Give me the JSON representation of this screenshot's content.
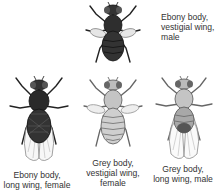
{
  "figure": {
    "flies": [
      {
        "id": "ebony-vestigial-male",
        "body": "ebony",
        "wing": "vestigial",
        "sex": "male",
        "label_lines": [
          "Ebony body,",
          "vestigial wing,",
          "male"
        ],
        "body_color": "#2e2e2e"
      },
      {
        "id": "ebony-long-female",
        "body": "ebony",
        "wing": "long",
        "sex": "female",
        "label_lines": [
          "Ebony body,",
          "long wing, female"
        ],
        "body_color": "#2a2a2a"
      },
      {
        "id": "grey-vestigial-female",
        "body": "grey",
        "wing": "vestigial",
        "sex": "female",
        "label_lines": [
          "Grey body,",
          "vestigial wing,",
          "female"
        ],
        "body_color": "#b9b9b9"
      },
      {
        "id": "grey-long-male",
        "body": "grey",
        "wing": "long",
        "sex": "male",
        "label_lines": [
          "Grey body,",
          "long wing, male"
        ],
        "body_color": "#9a9a9a"
      }
    ]
  },
  "colors": {
    "text": "#333333",
    "ebony": "#2e2e2e",
    "grey": "#b5b5b5",
    "outline": "#222222",
    "wing_stroke": "#8a8a8a"
  }
}
